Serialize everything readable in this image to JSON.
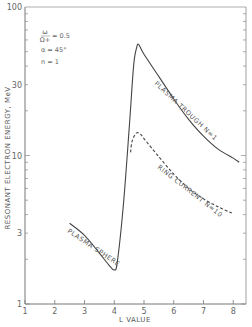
{
  "chart_data": {
    "type": "line",
    "title": "",
    "xlabel": "L VALUE",
    "ylabel": "RESONANT ELECTRON ENERGY, MeV",
    "xlim": [
      1,
      8.3
    ],
    "ylim": [
      1,
      100
    ],
    "yscale": "log",
    "grid": false,
    "x_ticks": [
      "1",
      "2",
      "3",
      "4",
      "5",
      "6",
      "7",
      "8"
    ],
    "y_ticks": [
      "1",
      "3",
      "10",
      "30",
      "100"
    ],
    "annotations": [
      "ω/Ω+ = 0.5",
      "α = 45°",
      "n = 1"
    ],
    "series": [
      {
        "name": "PLASMA SPHERE / PLASMA TROUGH N=1",
        "style": "solid",
        "points": [
          [
            2.5,
            3.5
          ],
          [
            3.0,
            2.9
          ],
          [
            3.5,
            2.2
          ],
          [
            3.85,
            1.8
          ],
          [
            4.0,
            1.7
          ],
          [
            4.1,
            1.9
          ],
          [
            4.3,
            4.5
          ],
          [
            4.5,
            15
          ],
          [
            4.65,
            40
          ],
          [
            4.75,
            53
          ],
          [
            4.82,
            56
          ],
          [
            5.0,
            48
          ],
          [
            5.5,
            34
          ],
          [
            6.0,
            24
          ],
          [
            6.5,
            17.5
          ],
          [
            7.0,
            13.5
          ],
          [
            7.5,
            11
          ],
          [
            8.0,
            9.6
          ],
          [
            8.2,
            9.0
          ]
        ]
      },
      {
        "name": "RING CURRENT N=10",
        "style": "dashed",
        "points": [
          [
            4.55,
            10.5
          ],
          [
            4.6,
            12.5
          ],
          [
            4.75,
            14.2
          ],
          [
            4.9,
            13.8
          ],
          [
            5.0,
            13
          ],
          [
            5.5,
            9.8
          ],
          [
            6.0,
            7.5
          ],
          [
            6.5,
            6.0
          ],
          [
            7.0,
            5.1
          ],
          [
            7.5,
            4.5
          ],
          [
            7.95,
            4.1
          ]
        ]
      }
    ],
    "curve_labels": [
      "PLASMA SPHERE",
      "PLASMA TROUGH N=1",
      "RING CURRENT N=10"
    ]
  },
  "labels": {
    "xlabel": "L VALUE",
    "ylabel": "RESONANT ELECTRON ENERGY, MeV",
    "annot_ratio_num": "ω",
    "annot_ratio_den": "Ω+",
    "annot_ratio_val": "= 0.5",
    "annot_alpha": "α = 45°",
    "annot_n": "n = 1",
    "plasma_sphere": "PLASMA SPHERE",
    "plasma_trough": "PLASMA TROUGH  N=1",
    "ring_current": "RING CURRENT  N=10"
  }
}
